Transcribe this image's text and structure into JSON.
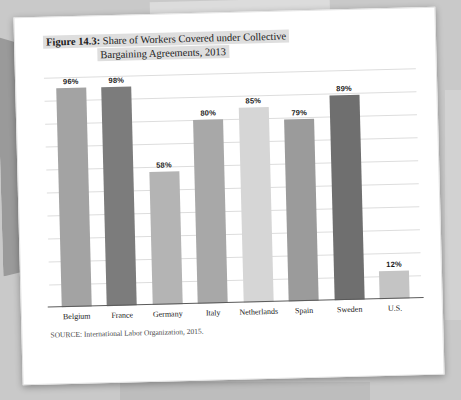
{
  "figure": {
    "number": "Figure 14.3:",
    "title_line1": "Share of Workers Covered under Collective",
    "title_line2": "Bargaining Agreements, 2013",
    "source": "SOURCE: International Labor Organization, 2015."
  },
  "chart_data": {
    "type": "bar",
    "title": "Figure 14.3: Share of Workers Covered under Collective Bargaining Agreements, 2013",
    "xlabel": "",
    "ylabel": "",
    "ylim": [
      0,
      100
    ],
    "grid": true,
    "legend": "none",
    "categories": [
      "Belgium",
      "France",
      "Germany",
      "Italy",
      "Netherlands",
      "Spain",
      "Sweden",
      "U.S."
    ],
    "values": [
      96,
      98,
      58,
      80,
      85,
      79,
      89,
      12
    ],
    "value_labels": [
      "96%",
      "98%",
      "58%",
      "80%",
      "85%",
      "79%",
      "89%",
      "12%"
    ],
    "bar_colors": [
      "#a3a3a3",
      "#7c7c7c",
      "#b4b4b4",
      "#a8a8a8",
      "#d6d6d6",
      "#9b9b9b",
      "#6f6f6f",
      "#c4c4c4"
    ],
    "gridline_count": 10
  },
  "colors": {
    "page": "#ffffff",
    "background": "#c9c9c9",
    "title_highlight": "#dedede",
    "gridline": "#dddddd",
    "axis": "#5a5a5a"
  }
}
